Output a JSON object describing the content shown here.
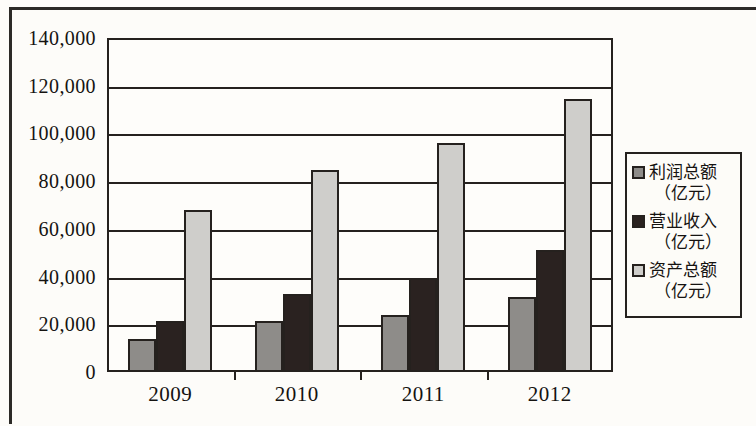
{
  "chart_data": {
    "type": "bar",
    "title": "",
    "subtitle": "",
    "xlabel": "",
    "ylabel": "",
    "categories": [
      "2009",
      "2010",
      "2011",
      "2012"
    ],
    "series": [
      {
        "name": "利润总额",
        "unit": "（亿元）",
        "color": "#8e8c89",
        "values": [
          14000,
          21500,
          24000,
          31500
        ]
      },
      {
        "name": "营业收入",
        "unit": "（亿元）",
        "color": "#2a2220",
        "values": [
          21500,
          32500,
          39500,
          51000
        ]
      },
      {
        "name": "资产总额",
        "unit": "（亿元）",
        "color": "#cfcecb",
        "values": [
          68000,
          84500,
          96000,
          114500
        ]
      }
    ],
    "ylim": [
      0,
      140000
    ],
    "ytick_step": 20000,
    "ytick_labels": [
      "140,000",
      "120,000",
      "100,000",
      "80,000",
      "60,000",
      "40,000",
      "20,000",
      "0"
    ],
    "ytick_values": [
      140000,
      120000,
      100000,
      80000,
      60000,
      40000,
      20000,
      0
    ],
    "grid": true,
    "grid_axis": "y",
    "legend_position": "right",
    "colors": {
      "axis": "#25211e",
      "background": "#fdfcf9",
      "plot_background": "#fefdfa",
      "text": "#151311"
    }
  }
}
